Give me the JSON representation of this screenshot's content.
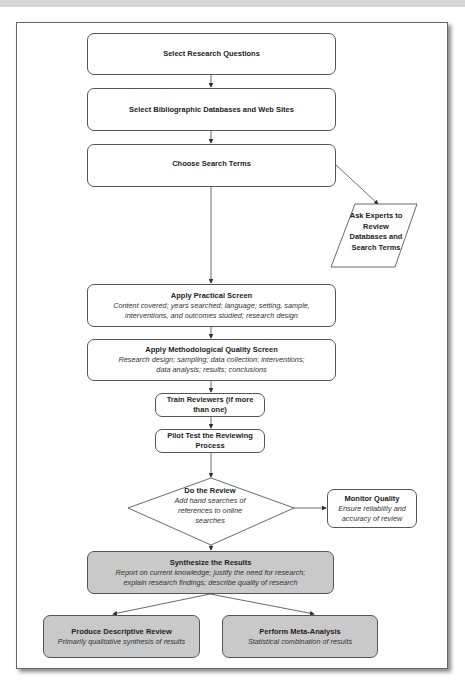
{
  "diagram": {
    "steps": [
      {
        "title": "Select Research Questions"
      },
      {
        "title": "Select Bibliographic Databases and Web Sites"
      },
      {
        "title": "Choose Search Terms"
      },
      {
        "title": "Apply Practical Screen",
        "subtitle_line1": "Content covered; years searched; language; setting, sample,",
        "subtitle_line2": "interventions, and outcomes studied; research design"
      },
      {
        "title": "Apply Methodological Quality Screen",
        "subtitle_line1": "Research design; sampling; data collection; interventions;",
        "subtitle_line2": "data analysis; results; conclusions"
      },
      {
        "title_line1": "Train Reviewers (if more",
        "title_line2": "than one)"
      },
      {
        "title_line1": "Pilot Test the Reviewing",
        "title_line2": "Process"
      }
    ],
    "side_input": {
      "lines": [
        "Ask Experts to",
        "Review",
        "Databases and",
        "Search Terms"
      ]
    },
    "decision": {
      "title": "Do the Review",
      "lines": [
        "Add hand searches of",
        "references to online",
        "searches"
      ]
    },
    "monitor": {
      "title": "Monitor Quality",
      "subtitle_line1": "Ensure reliability and",
      "subtitle_line2": "accuracy of review"
    },
    "synthesize": {
      "title": "Synthesize the Results",
      "subtitle_line1": "Report on current knowledge; justify the need for research;",
      "subtitle_line2": "explain research findings; describe quality of research"
    },
    "outputs": [
      {
        "title": "Produce Descriptive Review",
        "subtitle": "Primarily qualitative synthesis of results"
      },
      {
        "title": "Perform Meta-Analysis",
        "subtitle": "Statistical combination of results"
      }
    ],
    "colors": {
      "shaded_fill": "#c9c9c9",
      "stroke": "#555555",
      "header_band": "#d6d6d6"
    }
  }
}
